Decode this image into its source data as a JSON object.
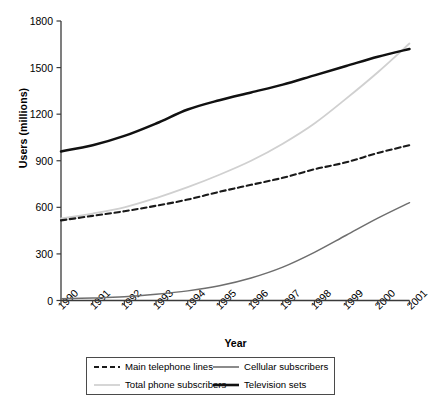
{
  "chart_data": {
    "type": "line",
    "title": "",
    "xlabel": "Year",
    "ylabel": "Users (millions)",
    "xlim": [
      1990,
      2001
    ],
    "ylim": [
      0,
      1800
    ],
    "yticks": [
      0,
      300,
      600,
      900,
      1200,
      1500,
      1800
    ],
    "grid": false,
    "legend_position": "below-axes",
    "x": [
      1990,
      1991,
      1992,
      1993,
      1994,
      1995,
      1996,
      1997,
      1998,
      1999,
      2000,
      2001
    ],
    "categories": [
      "1990",
      "1991",
      "1992",
      "1993",
      "1994",
      "1995",
      "1996",
      "1997",
      "1998",
      "1999",
      "2000",
      "2001"
    ],
    "series": [
      {
        "name": "Main telephone lines",
        "style": "dashed",
        "color": "#1a1a1a",
        "width": 2.1,
        "values": [
          516,
          545,
          575,
          610,
          650,
          700,
          745,
          790,
          845,
          890,
          950,
          1000
        ]
      },
      {
        "name": "Total phone subscribers",
        "style": "solid",
        "color": "#d0d0d0",
        "width": 1.8,
        "values": [
          528,
          560,
          600,
          660,
          730,
          810,
          900,
          1010,
          1140,
          1300,
          1470,
          1655
        ]
      },
      {
        "name": "Cellular subscribers",
        "style": "solid",
        "color": "#6e6e6e",
        "width": 1.5,
        "values": [
          11,
          16,
          24,
          40,
          62,
          95,
          145,
          215,
          310,
          420,
          530,
          630
        ]
      },
      {
        "name": "Television sets",
        "style": "solid",
        "color": "#111111",
        "width": 2.5,
        "values": [
          960,
          1000,
          1060,
          1140,
          1230,
          1290,
          1340,
          1390,
          1450,
          1510,
          1570,
          1620
        ]
      }
    ]
  },
  "axes": {
    "ytick_labels": [
      "1800",
      "1500",
      "1200",
      "900",
      "600",
      "300",
      "0"
    ],
    "xtick_labels": [
      "1990",
      "1991",
      "1992",
      "1993",
      "1994",
      "1995",
      "1996",
      "1997",
      "1998",
      "1999",
      "2000",
      "2001"
    ],
    "ylabel": "Users (millions)",
    "xlabel": "Year"
  },
  "legend": {
    "items": [
      {
        "label": "Main telephone lines",
        "swatch": "dashed-black-line-icon"
      },
      {
        "label": "Cellular subscribers",
        "swatch": "solid-gray-line-icon"
      },
      {
        "label": "Total phone subscribers",
        "swatch": "solid-lightgray-line-icon"
      },
      {
        "label": "Television sets",
        "swatch": "solid-black-thick-line-icon"
      }
    ]
  },
  "colors": {
    "axis": "#3a3a3a",
    "main_telephone_lines": "#1a1a1a",
    "total_phone_subscribers": "#d0d0d0",
    "cellular_subscribers": "#6e6e6e",
    "television_sets": "#111111",
    "legend_border": "#4a4a4a"
  }
}
